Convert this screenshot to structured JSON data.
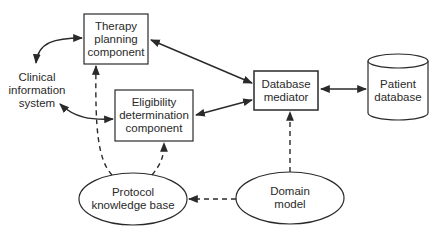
{
  "nodes": {
    "therapy_planning": {
      "label": "Therapy\nplanning\ncomponent",
      "shape": "rectangle"
    },
    "eligibility": {
      "label": "Eligibility\ndetermination\ncomponent",
      "shape": "rectangle"
    },
    "database_mediator": {
      "label": "Database\nmediator",
      "shape": "rectangle"
    },
    "patient_database": {
      "label": "Patient\ndatabase",
      "shape": "cylinder"
    },
    "clinical_info": {
      "label": "Clinical\ninformation\nsystem",
      "shape": "text"
    },
    "protocol_kb": {
      "label": "Protocol\nknowledge base",
      "shape": "ellipse"
    },
    "domain_model": {
      "label": "Domain\nmodel",
      "shape": "ellipse"
    }
  },
  "edges": [
    {
      "from": "clinical_info",
      "to": "therapy_planning",
      "style": "solid",
      "direction": "both"
    },
    {
      "from": "clinical_info",
      "to": "eligibility",
      "style": "solid",
      "direction": "both"
    },
    {
      "from": "therapy_planning",
      "to": "database_mediator",
      "style": "solid",
      "direction": "both"
    },
    {
      "from": "eligibility",
      "to": "database_mediator",
      "style": "solid",
      "direction": "both"
    },
    {
      "from": "database_mediator",
      "to": "patient_database",
      "style": "solid",
      "direction": "both"
    },
    {
      "from": "protocol_kb",
      "to": "therapy_planning",
      "style": "dashed",
      "direction": "forward"
    },
    {
      "from": "protocol_kb",
      "to": "eligibility",
      "style": "dashed",
      "direction": "forward"
    },
    {
      "from": "domain_model",
      "to": "database_mediator",
      "style": "dashed",
      "direction": "forward"
    },
    {
      "from": "domain_model",
      "to": "protocol_kb",
      "style": "dashed",
      "direction": "forward"
    }
  ],
  "colors": {
    "stroke": "#2a2a2a",
    "background": "#ffffff"
  }
}
